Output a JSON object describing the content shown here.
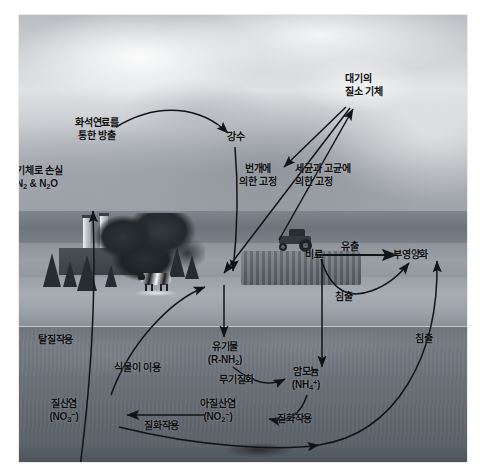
{
  "figure": {
    "type": "photographic-diagram",
    "background_color": "#ffffff",
    "plate_color": "#8d9094",
    "text_color": "#0c0e10"
  },
  "labels": {
    "fossil_fuel_emission": "화석연료를\n통한 방출",
    "fossil_fuel_emission_l1": "화석연료를",
    "fossil_fuel_emission_l2": "통한 방출",
    "gas_loss_l1": "기체로 손실",
    "gas_loss_l2": "N2 & N2O",
    "precipitation": "강수",
    "lightning_fixation_l1": "번개에",
    "lightning_fixation_l2": "의한 고정",
    "atmospheric_n2_l1": "대기의",
    "atmospheric_n2_l2": "질소 기체",
    "bacteria_archaea_fixation_l1": "세균과 고균에",
    "bacteria_archaea_fixation_l2": "의한 고정",
    "fertilizer": "비료",
    "runoff": "유출",
    "eutrophication": "부영양화",
    "leaching_upper": "침출",
    "leaching_right": "침출",
    "denitrification": "탈질작용",
    "plant_uptake": "식물이 이용",
    "organic_matter_l1": "유기물",
    "organic_matter_l2": "(R-NH2)",
    "mineralization": "무기질화",
    "ammonium_l1": "암모늄",
    "ammonium_l2": "(NH4+)",
    "nitrification_right": "질화작용",
    "nitrite_l1": "아질산염",
    "nitrite_l2": "(NO2-)",
    "nitrification_left": "질화작용",
    "nitrate_l1": "질산염",
    "nitrate_l2": "(NO3-)"
  },
  "chemical_parts": {
    "n2": {
      "base": "N",
      "sub": "2"
    },
    "n2o": {
      "base": "N",
      "sub": "2",
      "tail": "O"
    },
    "r_nh2": {
      "open": "(R-NH",
      "sub": "2",
      "close": ")"
    },
    "nh4": {
      "open": "(NH",
      "sub": "4",
      "sup": "+",
      "close": ")"
    },
    "no2": {
      "open": "(NO",
      "sub": "2",
      "sup": "−",
      "close": ")"
    },
    "no3": {
      "open": "(NO",
      "sub": "3",
      "sup": "−",
      "close": ")"
    }
  },
  "scene": {
    "elements": [
      "power-plant-with-two-smokestacks",
      "large-deciduous-tree",
      "conifer-trees",
      "dairy-cow",
      "hay-bale-row",
      "farm-tractor",
      "water-body",
      "soil-cross-section",
      "cloudy-sky"
    ]
  },
  "arrows": [
    {
      "name": "fossil-fuel-to-precipitation",
      "from": "화석연료를 통한 방출",
      "to": "강수"
    },
    {
      "name": "gas-loss-arrow",
      "from": "탈질작용",
      "to": "기체로 손실 N2 & N2O"
    },
    {
      "name": "atmospheric-n2-to-lightning",
      "from": "대기의 질소 기체",
      "to": "번개에 의한 고정"
    },
    {
      "name": "atmospheric-n2-to-soil-fixation",
      "from": "대기의 질소 기체",
      "to": "토양"
    },
    {
      "name": "lightning-fixation-to-ground",
      "from": "번개에 의한 고정",
      "to": "지표"
    },
    {
      "name": "fertilizer-to-runoff",
      "from": "비료",
      "to": "부영양화"
    },
    {
      "name": "fertilizer-leaching-to-eutrophication",
      "from": "비료",
      "to": "부영양화"
    },
    {
      "name": "fertilizer-to-ammonium",
      "from": "비료",
      "to": "암모늄"
    },
    {
      "name": "soil-leaching-to-eutrophication",
      "from": "토양",
      "to": "부영양화"
    },
    {
      "name": "organic-matter-input",
      "from": "지표",
      "to": "유기물"
    },
    {
      "name": "mineralization-arrow",
      "from": "유기물",
      "to": "암모늄"
    },
    {
      "name": "nitrification-ammonium-to-nitrite",
      "from": "암모늄",
      "to": "아질산염"
    },
    {
      "name": "nitrification-nitrite-to-nitrate",
      "from": "아질산염",
      "to": "질산염"
    },
    {
      "name": "nitrate-to-plant-uptake",
      "from": "질산염",
      "to": "식물"
    },
    {
      "name": "nitrate-to-denitrification",
      "from": "질산염",
      "to": "탈질작용"
    },
    {
      "name": "nitrate-leaching-curve",
      "from": "질산염",
      "to": "부영양화"
    }
  ]
}
